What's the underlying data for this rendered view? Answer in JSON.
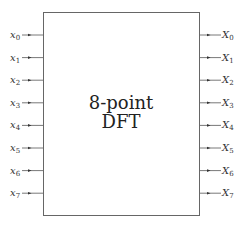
{
  "diagram": {
    "block": {
      "title_line1": "8-point",
      "title_line2": "DFT"
    },
    "inputs": [
      {
        "base": "x",
        "sub": "0"
      },
      {
        "base": "x",
        "sub": "1"
      },
      {
        "base": "x",
        "sub": "2"
      },
      {
        "base": "x",
        "sub": "3"
      },
      {
        "base": "x",
        "sub": "4"
      },
      {
        "base": "x",
        "sub": "5"
      },
      {
        "base": "x",
        "sub": "6"
      },
      {
        "base": "x",
        "sub": "7"
      }
    ],
    "outputs": [
      {
        "base": "X",
        "sub": "0"
      },
      {
        "base": "X",
        "sub": "1"
      },
      {
        "base": "X",
        "sub": "2"
      },
      {
        "base": "X",
        "sub": "3"
      },
      {
        "base": "X",
        "sub": "4"
      },
      {
        "base": "X",
        "sub": "5"
      },
      {
        "base": "X",
        "sub": "6"
      },
      {
        "base": "X",
        "sub": "7"
      }
    ],
    "colors": {
      "line": "#555555",
      "text": "#333333"
    }
  }
}
